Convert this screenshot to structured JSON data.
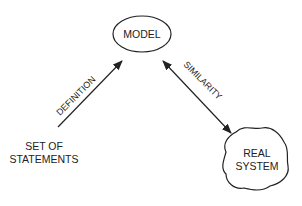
{
  "diagram": {
    "nodes": {
      "model": {
        "label": "MODEL",
        "shape": "ellipse"
      },
      "statements": {
        "line1": "SET OF",
        "line2": "STATEMENTS",
        "shape": "text"
      },
      "real_system": {
        "line1": "REAL",
        "line2": "SYSTEM",
        "shape": "cloud"
      }
    },
    "edges": {
      "definition": {
        "label": "DEFINITION",
        "from": "statements",
        "to": "model",
        "direction": "forward"
      },
      "similarity": {
        "label": "SIMILARITY",
        "from": "model",
        "to": "real_system",
        "direction": "both"
      }
    },
    "colors": {
      "stroke": "#222222",
      "background": "#ffffff"
    }
  }
}
